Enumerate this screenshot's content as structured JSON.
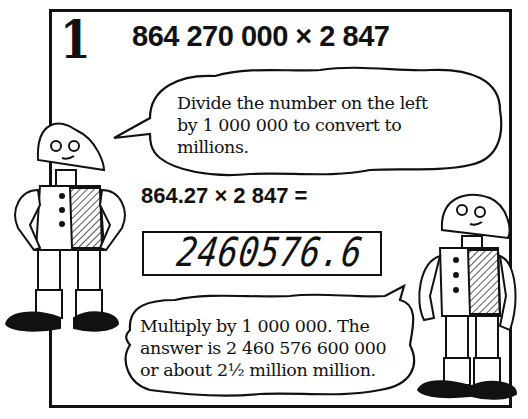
{
  "panel": {
    "number": "1",
    "headline": "864 270 000 × 2 847",
    "bubble_top": {
      "lines": [
        "Divide the number on the left",
        "by 1 000 000 to convert to",
        "millions."
      ]
    },
    "equation": "864.27 × 2 847 =",
    "calculator_display": "2460576.6",
    "bubble_bottom": {
      "lines": [
        "Multiply by 1 000 000. The",
        "answer is 2 460 576 600 000",
        "or about 2½ million million."
      ]
    },
    "characters": [
      "robot-left",
      "robot-right"
    ]
  }
}
